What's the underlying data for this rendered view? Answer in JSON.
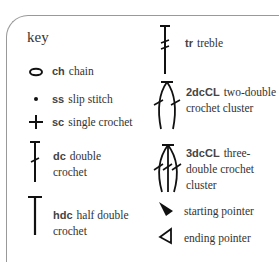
{
  "key": {
    "title": "key",
    "left_column": [
      {
        "icon": "chain-oval-icon",
        "abbr": "ch",
        "label": "chain"
      },
      {
        "icon": "slip-stitch-dot-icon",
        "abbr": "ss",
        "label": "slip stitch"
      },
      {
        "icon": "single-crochet-plus-icon",
        "abbr": "sc",
        "label": "single crochet"
      },
      {
        "icon": "double-crochet-icon",
        "abbr": "dc",
        "label": "double crochet"
      },
      {
        "icon": "half-double-crochet-icon",
        "abbr": "hdc",
        "label": "half double crochet"
      }
    ],
    "right_column": [
      {
        "icon": "treble-icon",
        "abbr": "tr",
        "label": "treble"
      },
      {
        "icon": "two-dc-cluster-icon",
        "abbr": "2dcCL",
        "label": "two-double crochet cluster"
      },
      {
        "icon": "three-dc-cluster-icon",
        "abbr": "3dcCL",
        "label": "three-double crochet cluster"
      },
      {
        "icon": "starting-pointer-icon",
        "abbr": "",
        "label": "starting pointer"
      },
      {
        "icon": "ending-pointer-icon",
        "abbr": "",
        "label": "ending pointer"
      }
    ]
  }
}
